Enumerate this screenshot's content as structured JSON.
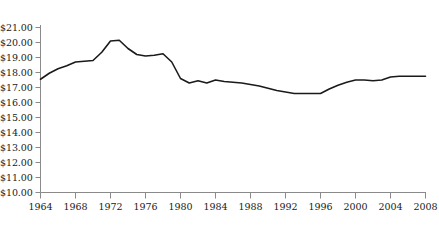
{
  "chart_data": {
    "type": "line",
    "title": "",
    "subtitle": "",
    "xlabel": "",
    "ylabel": "",
    "grid": false,
    "legend_position": "none",
    "xlim": [
      1964,
      2008
    ],
    "ylim": [
      10.0,
      21.0
    ],
    "x_tick_labels": [
      "1964",
      "1968",
      "1972",
      "1976",
      "1980",
      "1984",
      "1988",
      "1992",
      "1996",
      "2000",
      "2004",
      "2008"
    ],
    "x_ticks": [
      1964,
      1968,
      1972,
      1976,
      1980,
      1984,
      1988,
      1992,
      1996,
      2000,
      2004,
      2008
    ],
    "y_tick_labels": [
      "$21.00",
      "$20.00",
      "$19.00",
      "$18.00",
      "$17.00",
      "$16.00",
      "$15.00",
      "$14.00",
      "$13.00",
      "$12.00",
      "$11.00",
      "$10.00"
    ],
    "y_ticks": [
      21.0,
      20.0,
      19.0,
      18.0,
      17.0,
      16.0,
      15.0,
      14.0,
      13.0,
      12.0,
      11.0,
      10.0
    ],
    "series": [
      {
        "name": "value",
        "color": "#1a1a1a",
        "x": [
          1964,
          1965,
          1966,
          1967,
          1968,
          1969,
          1970,
          1971,
          1972,
          1973,
          1974,
          1975,
          1976,
          1977,
          1978,
          1979,
          1980,
          1981,
          1982,
          1983,
          1984,
          1985,
          1986,
          1987,
          1988,
          1989,
          1990,
          1991,
          1992,
          1993,
          1994,
          1995,
          1996,
          1997,
          1998,
          1999,
          2000,
          2001,
          2002,
          2003,
          2004,
          2005,
          2006,
          2007,
          2008
        ],
        "values": [
          17.55,
          17.95,
          18.25,
          18.45,
          18.7,
          18.75,
          18.8,
          19.35,
          20.1,
          20.15,
          19.6,
          19.2,
          19.1,
          19.15,
          19.25,
          18.7,
          17.6,
          17.3,
          17.45,
          17.3,
          17.5,
          17.4,
          17.35,
          17.3,
          17.2,
          17.1,
          16.95,
          16.8,
          16.7,
          16.6,
          16.6,
          16.6,
          16.6,
          16.9,
          17.15,
          17.35,
          17.5,
          17.5,
          17.45,
          17.5,
          17.7,
          17.75,
          17.75,
          17.75,
          17.75
        ]
      }
    ]
  },
  "axes": {
    "axis_color": "#8a8a8a",
    "line_color": "#1a1a1a"
  }
}
